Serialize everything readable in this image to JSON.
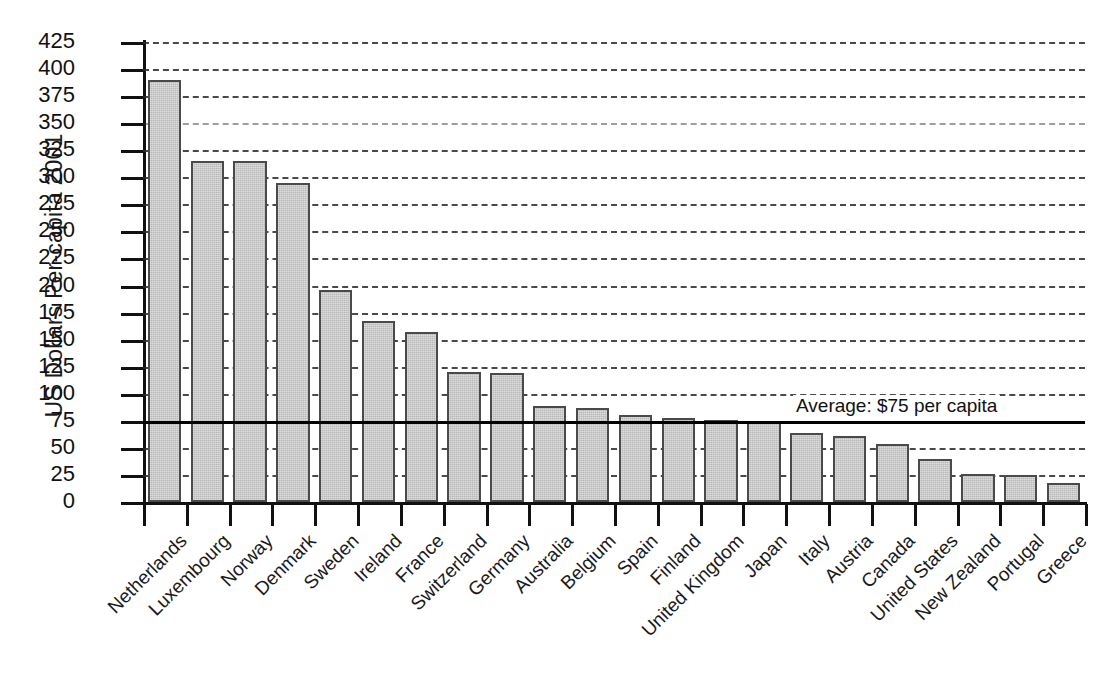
{
  "chart_data": {
    "type": "bar",
    "title": "",
    "xlabel": "",
    "ylabel": "US Dollars Per-capita 2001",
    "ylim": [
      0,
      425
    ],
    "ytick_step": 25,
    "grid": true,
    "legend": "none",
    "categories": [
      "Netherlands",
      "Luxembourg",
      "Norway",
      "Denmark",
      "Sweden",
      "Ireland",
      "France",
      "Switzerland",
      "Germany",
      "Australia",
      "Belgium",
      "Spain",
      "Finland",
      "United Kingdom",
      "Japan",
      "Italy",
      "Austria",
      "Canada",
      "United States",
      "New Zealand",
      "Portugal",
      "Greece"
    ],
    "values": [
      390,
      315,
      315,
      295,
      196,
      167,
      157,
      120,
      119,
      89,
      87,
      80,
      78,
      76,
      75,
      64,
      61,
      54,
      40,
      26,
      25,
      18
    ],
    "ytick_labels": [
      "0",
      "25",
      "50",
      "75",
      "100",
      "125",
      "150",
      "175",
      "200",
      "225",
      "250",
      "275",
      "300",
      "325",
      "350",
      "375",
      "400",
      "425"
    ],
    "annotations": [
      {
        "name": "average-line",
        "label": "Average: $75 per capita",
        "value": 75
      }
    ],
    "colors": {
      "bar_fill": "#b9b9b9",
      "bar_stroke": "#4a4a4a",
      "grid": "#2a2a2a",
      "axis": "#111111",
      "average_line": "#000000",
      "background": "#ffffff"
    }
  }
}
